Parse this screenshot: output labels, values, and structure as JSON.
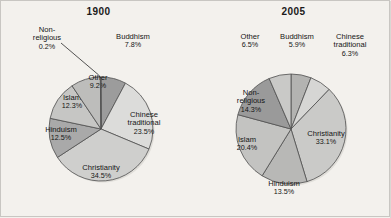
{
  "figure": {
    "background_color": "#f3f1ed",
    "border_color": "#c8c6c2",
    "label_text_color": "#151515",
    "slice_outline_color": "#4f4f4f"
  },
  "chart_data": [
    {
      "type": "pie",
      "title": "1900",
      "xlabel": "",
      "ylabel": "",
      "legend": "none",
      "grid": false,
      "start_angle_deg": 0,
      "direction": "clockwise",
      "center": [
        100,
        128
      ],
      "radius": 52,
      "categories": [
        "Buddhism",
        "Chinese traditional",
        "Christianity",
        "Hinduism",
        "Islam",
        "Other",
        "Non-religious"
      ],
      "values": [
        7.8,
        23.5,
        34.5,
        12.5,
        12.3,
        9.2,
        0.2
      ],
      "value_labels": [
        "7.8%",
        "23.5%",
        "34.5%",
        "12.5%",
        "12.3%",
        "9.2%",
        "0.2%"
      ],
      "colors": [
        "#9c9c9c",
        "#dcdcda",
        "#cfcfcd",
        "#a9a9a9",
        "#c6c6c4",
        "#bdbdbb",
        "#8f8f8f"
      ],
      "slices": [
        {
          "name": "Buddhism",
          "value": 7.8,
          "value_label": "7.8%",
          "color": "#9c9c9c",
          "label_placement": "outside",
          "label_x": 132,
          "label_y": 36,
          "callout": false
        },
        {
          "name": "Chinese traditional",
          "value": 23.5,
          "value_label": "23.5%",
          "color": "#dcdcda",
          "label_placement": "inside",
          "label_x": 143,
          "label_y": 118,
          "callout": false
        },
        {
          "name": "Christianity",
          "value": 34.5,
          "value_label": "34.5%",
          "color": "#cfcfcd",
          "label_placement": "inside",
          "label_x": 100,
          "label_y": 167,
          "callout": false
        },
        {
          "name": "Hinduism",
          "value": 12.5,
          "value_label": "12.5%",
          "color": "#a9a9a9",
          "label_placement": "inside",
          "label_x": 60,
          "label_y": 129,
          "callout": false
        },
        {
          "name": "Islam",
          "value": 12.3,
          "value_label": "12.3%",
          "color": "#c6c6c4",
          "label_placement": "inside",
          "label_x": 71,
          "label_y": 97,
          "callout": false
        },
        {
          "name": "Other",
          "value": 9.2,
          "value_label": "9.2%",
          "color": "#bdbdbb",
          "label_placement": "inside",
          "label_x": 97,
          "label_y": 77,
          "callout": false
        },
        {
          "name": "Non-religious",
          "value": 0.2,
          "value_label": "0.2%",
          "color": "#8f8f8f",
          "label_placement": "callout",
          "label_x": 46,
          "label_y": 33,
          "callout": true
        }
      ]
    },
    {
      "type": "pie",
      "title": "2005",
      "xlabel": "",
      "ylabel": "",
      "legend": "none",
      "grid": false,
      "start_angle_deg": 0,
      "direction": "clockwise",
      "center": [
        290,
        128
      ],
      "radius": 55,
      "categories": [
        "Buddhism",
        "Chinese traditional",
        "Christianity",
        "Hinduism",
        "Islam",
        "Non-religious",
        "Other"
      ],
      "values": [
        5.9,
        6.3,
        33.1,
        13.5,
        20.4,
        14.3,
        6.5
      ],
      "value_labels": [
        "5.9%",
        "6.3%",
        "33.1%",
        "13.5%",
        "20.4%",
        "14.3%",
        "6.5%"
      ],
      "colors": [
        "#b3b3b1",
        "#d6d6d4",
        "#cacac8",
        "#b8b8b6",
        "#c3c3c1",
        "#9a9a9a",
        "#c9c9c7"
      ],
      "slices": [
        {
          "name": "Buddhism",
          "value": 5.9,
          "value_label": "5.9%",
          "color": "#b3b3b1",
          "label_placement": "outside",
          "label_x": 296,
          "label_y": 36,
          "callout": false
        },
        {
          "name": "Chinese traditional",
          "value": 6.3,
          "value_label": "6.3%",
          "color": "#d6d6d4",
          "label_placement": "outside",
          "label_x": 349,
          "label_y": 40,
          "callout": false
        },
        {
          "name": "Christianity",
          "value": 33.1,
          "value_label": "33.1%",
          "color": "#cacac8",
          "label_placement": "inside",
          "label_x": 325,
          "label_y": 133,
          "callout": false
        },
        {
          "name": "Hinduism",
          "value": 13.5,
          "value_label": "13.5%",
          "color": "#b8b8b6",
          "label_placement": "inside",
          "label_x": 283,
          "label_y": 183,
          "callout": false
        },
        {
          "name": "Islam",
          "value": 20.4,
          "value_label": "20.4%",
          "color": "#c3c3c1",
          "label_placement": "inside",
          "label_x": 246,
          "label_y": 139,
          "callout": false
        },
        {
          "name": "Non-religious",
          "value": 14.3,
          "value_label": "14.3%",
          "color": "#9a9a9a",
          "label_placement": "inside",
          "label_x": 250,
          "label_y": 96,
          "callout": false
        },
        {
          "name": "Other",
          "value": 6.5,
          "value_label": "6.5%",
          "color": "#c9c9c7",
          "label_placement": "outside",
          "label_x": 249,
          "label_y": 36,
          "callout": false
        }
      ]
    }
  ]
}
